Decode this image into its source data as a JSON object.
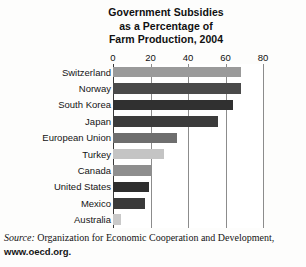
{
  "chart_data": {
    "type": "bar",
    "orientation": "horizontal",
    "title": "Government Subsidies as a Percentage of Farm Production, 2004",
    "title_lines": [
      "Government Subsidies",
      "as a Percentage of",
      "Farm Production, 2004"
    ],
    "categories": [
      "Switzerland",
      "Norway",
      "South Korea",
      "Japan",
      "European Union",
      "Turkey",
      "Canada",
      "United States",
      "Mexico",
      "Australia"
    ],
    "values": [
      68,
      68,
      64,
      56,
      34,
      27,
      21,
      19,
      17,
      4
    ],
    "bar_colors": [
      "#9a9a9a",
      "#4a4a4a",
      "#303030",
      "#3b3b3b",
      "#6e6e6e",
      "#c4c4c4",
      "#8e8e8e",
      "#2e2e2e",
      "#3a3a3a",
      "#c9c9c9"
    ],
    "xlabel": "",
    "ylabel": "",
    "xlim": [
      0,
      80
    ],
    "xticks": [
      0,
      20,
      40,
      60,
      80
    ],
    "xtick_labels": [
      "0",
      "20",
      "40",
      "60",
      "80"
    ],
    "grid": true,
    "grid_axis": "x",
    "legend": false,
    "units": "percent"
  },
  "source": {
    "prefix": "Source:",
    "text": " Organization for Economic Cooperation and Development,",
    "url": "www.oecd.org."
  }
}
